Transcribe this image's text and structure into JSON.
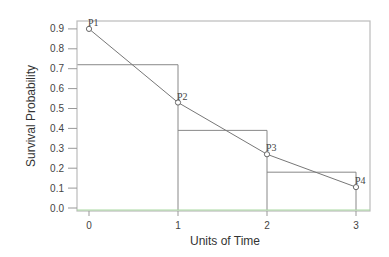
{
  "chart_data": {
    "type": "line",
    "title": "",
    "xlabel": "Units of Time",
    "ylabel": "Survival Probability",
    "xlim": [
      0,
      3
    ],
    "ylim": [
      0.0,
      0.9
    ],
    "x_ticks": [
      "0",
      "1",
      "2",
      "3"
    ],
    "y_ticks": [
      "0.0",
      "0.1",
      "0.2",
      "0.3",
      "0.4",
      "0.5",
      "0.6",
      "0.7",
      "0.8",
      "0.9"
    ],
    "grid": false,
    "series": [
      {
        "name": "survival points",
        "x": [
          0,
          1,
          2,
          3
        ],
        "values": [
          0.9,
          0.53,
          0.27,
          0.105
        ],
        "labels": [
          "P1",
          "P2",
          "P3",
          "P4"
        ]
      }
    ],
    "step_rectangles": [
      {
        "x_start": -0.13,
        "x_end": 1,
        "height": 0.72
      },
      {
        "x_start": 1,
        "x_end": 2,
        "height": 0.39
      },
      {
        "x_start": 2,
        "x_end": 3,
        "height": 0.18
      }
    ],
    "colors": {
      "frame": "#bbbbbb",
      "line": "#777777",
      "baseline": "#a8d8a0"
    }
  }
}
